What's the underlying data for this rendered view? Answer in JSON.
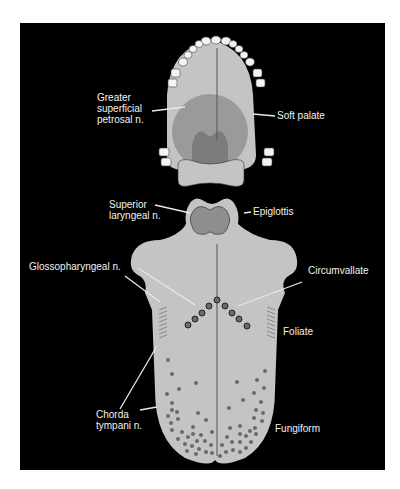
{
  "figure": {
    "colors": {
      "background": "#000000",
      "tissue": "#c4c4c4",
      "soft_palate": "#9a9a9a",
      "uvula_region": "#7c7c7c",
      "epiglottis": "#8e8e8e",
      "papilla": "#6a6a6a",
      "tooth": "#f4f4f4",
      "label": "#f2f2f2",
      "leader": "#e8e8e8"
    }
  },
  "labels": {
    "greater_superficial_petrosal": [
      "Greater",
      "superficial",
      "petrosal n."
    ],
    "soft_palate": "Soft palate",
    "superior_laryngeal": [
      "Superior",
      "laryngeal n."
    ],
    "epiglottis": "Epiglottis",
    "glossopharyngeal": "Glossopharyngeal n.",
    "circumvallate": "Circumvallate",
    "foliate": "Foliate",
    "chorda_tympani": [
      "Chorda",
      "tympani n."
    ],
    "fungiform": "Fungiform"
  },
  "structures": {
    "palate": [
      "teeth",
      "hard palate",
      "soft palate",
      "uvula region"
    ],
    "tongue": [
      "epiglottis",
      "circumvallate papillae (9, V-shaped)",
      "foliate papillae (lateral ridges)",
      "fungiform papillae (anterior dots)",
      "midline sulcus"
    ]
  }
}
